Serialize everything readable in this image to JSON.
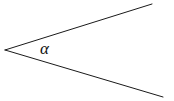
{
  "figure": {
    "type": "geometry-diagram",
    "background_color": "#ffffff",
    "stroke_color": "#1a1a1a",
    "stroke_width": 1,
    "canvas": {
      "width": 174,
      "height": 101
    },
    "vertex": {
      "x": 5,
      "y": 50
    },
    "rays": [
      {
        "name": "upper-ray",
        "from": {
          "x": 5,
          "y": 50
        },
        "to": {
          "x": 152,
          "y": 4
        }
      },
      {
        "name": "lower-ray",
        "from": {
          "x": 5,
          "y": 50
        },
        "to": {
          "x": 163,
          "y": 97
        }
      }
    ],
    "labels": [
      {
        "name": "angle-alpha",
        "text": "α",
        "x": 40,
        "y": 40,
        "color": "#111111"
      }
    ]
  }
}
